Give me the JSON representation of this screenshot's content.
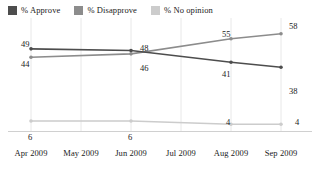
{
  "legend": {
    "position": "top-left",
    "items": [
      {
        "label": "% Approve",
        "color": "#4d4d4d",
        "icon": "legend-swatch-icon"
      },
      {
        "label": "% Disapprove",
        "color": "#8c8c8c",
        "icon": "legend-swatch-icon"
      },
      {
        "label": "% No opinion",
        "color": "#cccccc",
        "icon": "legend-swatch-icon"
      }
    ]
  },
  "chart_data": {
    "type": "line",
    "title": "",
    "subtitle": "",
    "xlabel": "",
    "ylabel": "",
    "grid": "vertical",
    "ylim": [
      0,
      65
    ],
    "legend_position": "top-left",
    "categories": [
      "Apr 2009",
      "May 2009",
      "Jun 2009",
      "Jul 2009",
      "Aug 2009",
      "Sep 2009"
    ],
    "series": [
      {
        "name": "% Approve",
        "color": "#4d4d4d",
        "values": [
          49,
          null,
          48,
          null,
          41,
          38
        ],
        "point_labels": [
          "49",
          "",
          "48",
          "",
          "41",
          "38"
        ]
      },
      {
        "name": "% Disapprove",
        "color": "#8c8c8c",
        "values": [
          44,
          null,
          46,
          null,
          55,
          58
        ],
        "point_labels": [
          "44",
          "",
          "46",
          "",
          "55",
          "58"
        ]
      },
      {
        "name": "% No opinion",
        "color": "#cccccc",
        "values": [
          6,
          null,
          6,
          null,
          4,
          4
        ],
        "point_labels": [
          "6",
          "",
          "6",
          "",
          "4",
          "4"
        ]
      }
    ]
  },
  "labels": {
    "approve": {
      "apr": "49",
      "jun": "48",
      "aug": "41",
      "sep": "38"
    },
    "disapprove": {
      "apr": "44",
      "jun": "46",
      "aug": "55",
      "sep": "58"
    },
    "no_opinion": {
      "apr": "6",
      "jun": "6",
      "aug": "4",
      "sep": "4"
    }
  },
  "xaxis": {
    "ticks": [
      "Apr 2009",
      "May 2009",
      "Jun 2009",
      "Jul 2009",
      "Aug 2009",
      "Sep 2009"
    ]
  },
  "colors": {
    "approve": "#4d4d4d",
    "disapprove": "#8c8c8c",
    "no_opinion": "#cccccc",
    "gridline": "#e8e8e8",
    "axis": "#d0d0d0",
    "text": "#1a1a1a"
  }
}
